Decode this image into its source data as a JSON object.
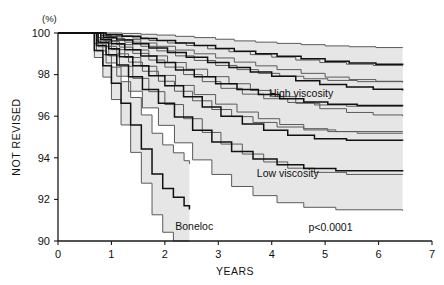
{
  "chart_data": {
    "type": "line",
    "title": "",
    "xlabel": "YEARS",
    "ylabel": "NOT REVISED",
    "yunit": "(%)",
    "xlim": [
      0,
      7
    ],
    "ylim": [
      90,
      100
    ],
    "xticks": [
      0,
      1,
      2,
      3,
      4,
      5,
      6,
      7
    ],
    "xticklabels": [
      "0",
      "1",
      "2",
      "3",
      "4",
      "5",
      "6",
      "7"
    ],
    "yticks": [
      90,
      92,
      94,
      96,
      98,
      100
    ],
    "yticklabels": [
      "90",
      "92",
      "94",
      "96",
      "98",
      "100"
    ],
    "grid": false,
    "legend_position": "inline-annotations",
    "annotations": [
      {
        "text": "High viscosity",
        "x": 4.55,
        "y": 96.9
      },
      {
        "text": "Low viscosity",
        "x": 4.3,
        "y": 93.1
      },
      {
        "text": "Boneloc",
        "x": 2.55,
        "y": 90.55
      },
      {
        "text": "p<0.0001",
        "x": 5.1,
        "y": 90.5
      }
    ],
    "series": [
      {
        "name": "High viscosity",
        "color": "#111111",
        "band_color": "#e6e6e6",
        "x": [
          0.0,
          0.62,
          0.9,
          1.2,
          1.55,
          1.85,
          2.2,
          2.55,
          2.95,
          3.3,
          3.7,
          4.1,
          4.55,
          5.0,
          5.45,
          5.95,
          6.45
        ],
        "y": [
          100.0,
          100.0,
          99.92,
          99.84,
          99.74,
          99.64,
          99.52,
          99.4,
          99.26,
          99.12,
          99.0,
          98.88,
          98.76,
          98.64,
          98.56,
          98.5,
          98.46
        ],
        "upper": [
          100.0,
          100.0,
          100.0,
          99.98,
          99.94,
          99.9,
          99.84,
          99.78,
          99.7,
          99.62,
          99.56,
          99.5,
          99.44,
          99.38,
          99.34,
          99.3,
          99.28
        ],
        "lower": [
          100.0,
          100.0,
          99.82,
          99.68,
          99.52,
          99.36,
          99.18,
          99.0,
          98.8,
          98.6,
          98.42,
          98.24,
          98.06,
          97.88,
          97.76,
          97.68,
          97.62
        ]
      },
      {
        "name": "High viscosity band 2",
        "color": "#111111",
        "band_color": "#e6e6e6",
        "x": [
          0.0,
          0.62,
          0.85,
          1.1,
          1.4,
          1.7,
          2.05,
          2.4,
          2.8,
          3.2,
          3.6,
          4.0,
          4.45,
          4.9,
          5.4,
          5.9,
          6.45
        ],
        "y": [
          100.0,
          100.0,
          99.8,
          99.66,
          99.48,
          99.28,
          99.06,
          98.84,
          98.58,
          98.34,
          98.12,
          97.92,
          97.7,
          97.52,
          97.4,
          97.3,
          97.24
        ],
        "upper": [
          100.0,
          100.0,
          99.94,
          99.86,
          99.76,
          99.64,
          99.52,
          99.4,
          99.24,
          99.1,
          98.96,
          98.84,
          98.7,
          98.58,
          98.5,
          98.44,
          98.4
        ],
        "lower": [
          100.0,
          100.0,
          99.64,
          99.44,
          99.18,
          98.9,
          98.58,
          98.26,
          97.9,
          97.56,
          97.24,
          96.94,
          96.62,
          96.36,
          96.18,
          96.06,
          96.0
        ]
      },
      {
        "name": "Mid band A",
        "color": "#111111",
        "band_color": "#e6e6e6",
        "x": [
          0.0,
          0.6,
          0.8,
          1.0,
          1.25,
          1.55,
          1.85,
          2.2,
          2.55,
          2.95,
          3.35,
          3.75,
          4.15,
          4.6,
          5.05,
          5.6,
          6.45
        ],
        "y": [
          100.0,
          100.0,
          99.7,
          99.48,
          99.2,
          98.9,
          98.58,
          98.22,
          97.9,
          97.56,
          97.28,
          97.04,
          96.84,
          96.68,
          96.58,
          96.52,
          96.5
        ],
        "upper": [
          100.0,
          100.0,
          99.88,
          99.74,
          99.56,
          99.36,
          99.14,
          98.9,
          98.68,
          98.44,
          98.24,
          98.06,
          97.92,
          97.8,
          97.72,
          97.66,
          97.64
        ],
        "lower": [
          100.0,
          100.0,
          99.5,
          99.2,
          98.82,
          98.4,
          97.96,
          97.48,
          97.04,
          96.58,
          96.2,
          95.88,
          95.6,
          95.4,
          95.26,
          95.18,
          95.16
        ]
      },
      {
        "name": "Mid band B",
        "color": "#111111",
        "band_color": "#e6e6e6",
        "x": [
          0.0,
          0.58,
          0.75,
          0.95,
          1.15,
          1.4,
          1.7,
          2.0,
          2.35,
          2.7,
          3.05,
          3.45,
          3.85,
          4.3,
          4.8,
          5.4,
          6.45
        ],
        "y": [
          100.0,
          100.0,
          99.56,
          99.24,
          98.86,
          98.42,
          97.94,
          97.46,
          96.94,
          96.44,
          96.0,
          95.62,
          95.32,
          95.08,
          94.92,
          94.84,
          94.82
        ],
        "upper": [
          100.0,
          100.0,
          99.78,
          99.58,
          99.32,
          99.02,
          98.7,
          98.36,
          98.0,
          97.66,
          97.34,
          97.06,
          96.84,
          96.66,
          96.54,
          96.48,
          96.46
        ],
        "lower": [
          100.0,
          100.0,
          99.34,
          98.9,
          98.4,
          97.82,
          97.18,
          96.56,
          95.88,
          95.22,
          94.66,
          94.18,
          93.8,
          93.5,
          93.3,
          93.2,
          93.18
        ]
      },
      {
        "name": "Low viscosity",
        "color": "#111111",
        "band_color": "#e6e6e6",
        "x": [
          0.0,
          0.55,
          0.72,
          0.9,
          1.1,
          1.32,
          1.58,
          1.88,
          2.18,
          2.52,
          2.88,
          3.25,
          3.65,
          4.1,
          4.6,
          5.2,
          6.45
        ],
        "y": [
          100.0,
          100.0,
          99.4,
          98.96,
          98.46,
          97.9,
          97.28,
          96.62,
          95.96,
          95.32,
          94.76,
          94.3,
          93.94,
          93.66,
          93.48,
          93.38,
          93.34
        ],
        "upper": [
          100.0,
          100.0,
          99.66,
          99.36,
          99.0,
          98.6,
          98.16,
          97.68,
          97.2,
          96.74,
          96.32,
          95.98,
          95.7,
          95.48,
          95.34,
          95.26,
          95.24
        ],
        "lower": [
          100.0,
          100.0,
          99.14,
          98.56,
          97.92,
          97.2,
          96.4,
          95.56,
          94.72,
          93.9,
          93.2,
          92.62,
          92.18,
          91.84,
          91.62,
          91.5,
          91.46
        ]
      },
      {
        "name": "Boneloc",
        "color": "#111111",
        "band_color": "#e6e6e6",
        "x": [
          0.0,
          0.52,
          0.68,
          0.84,
          1.0,
          1.18,
          1.36,
          1.56,
          1.76,
          1.96,
          2.16,
          2.36,
          2.46
        ],
        "y": [
          100.0,
          100.0,
          99.16,
          98.42,
          97.58,
          96.62,
          95.58,
          94.42,
          93.22,
          92.52,
          92.1,
          91.7,
          91.52
        ],
        "upper": [
          100.0,
          100.0,
          99.5,
          98.96,
          98.36,
          97.66,
          96.9,
          96.06,
          95.18,
          94.62,
          94.24,
          93.86,
          93.7
        ],
        "lower": [
          100.0,
          100.0,
          98.82,
          97.88,
          96.8,
          95.58,
          94.26,
          92.78,
          91.26,
          90.42,
          90.0,
          90.0,
          90.0
        ]
      }
    ]
  }
}
